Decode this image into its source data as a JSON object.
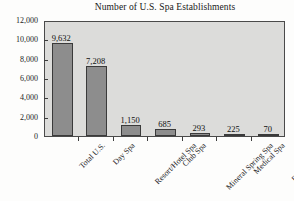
{
  "chart_data": {
    "type": "bar",
    "title": "Number of U.S. Spa Establishments",
    "xlabel": "",
    "ylabel": "",
    "categories": [
      "Total U.S.",
      "Day Spa",
      "Resort/Hotel Spa",
      "Club Spa",
      "Mineral Spring Spa",
      "Medical Spa",
      "Destination Spa"
    ],
    "values": [
      9632,
      7208,
      1150,
      685,
      293,
      225,
      70
    ],
    "value_labels": [
      "9,632",
      "7,208",
      "1,150",
      "685",
      "293",
      "225",
      "70"
    ],
    "ylim": [
      0,
      12000
    ],
    "ytick_values": [
      0,
      2000,
      4000,
      6000,
      8000,
      10000,
      12000
    ],
    "ytick_labels": [
      "0",
      "2,000",
      "4,000",
      "6,000",
      "8,000",
      "10,000",
      "12,000"
    ],
    "grid": false,
    "legend": false,
    "colors": {
      "bar_fill": "#8d8d8d",
      "bar_edge": "#3a3a3a",
      "plot_background": "#dcdcda",
      "figure_background": "#fdfdfc",
      "axis": "#4a4a4a",
      "text": "#1c1c1c"
    }
  }
}
